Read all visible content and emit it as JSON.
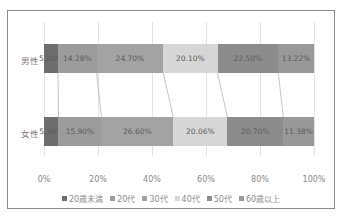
{
  "chart_data": {
    "type": "bar",
    "orientation": "horizontal",
    "stacked": "percent",
    "title": "",
    "xlabel": "",
    "ylabel": "",
    "xlim": [
      0,
      100
    ],
    "grid": true,
    "legend_position": "bottom",
    "categories": [
      "男性",
      "女性"
    ],
    "x_ticks": [
      "0%",
      "20%",
      "40%",
      "60%",
      "80%",
      "100%"
    ],
    "series": [
      {
        "name": "20歳未満",
        "color": "#6e6e6e",
        "values": [
          5.2,
          5.36
        ],
        "labels": [
          "5.20%",
          "5.36%"
        ]
      },
      {
        "name": "20代",
        "color": "#9c9c9c",
        "values": [
          14.28,
          15.9
        ],
        "labels": [
          "14.28%",
          "15.90%"
        ]
      },
      {
        "name": "30代",
        "color": "#a3a3a3",
        "values": [
          24.7,
          26.6
        ],
        "labels": [
          "24.70%",
          "26.60%"
        ]
      },
      {
        "name": "40代",
        "color": "#d6d6d6",
        "values": [
          20.1,
          20.06
        ],
        "labels": [
          "20.10%",
          "20.06%"
        ]
      },
      {
        "name": "50代",
        "color": "#8c8c8c",
        "values": [
          22.5,
          20.7
        ],
        "labels": [
          "22.50%",
          "20.70%"
        ]
      },
      {
        "name": "60歳以上",
        "color": "#999999",
        "values": [
          13.22,
          11.38
        ],
        "labels": [
          "13.22%",
          "11.38%"
        ]
      }
    ],
    "series_lines": true
  },
  "axis": {
    "ticks": [
      "0%",
      "20%",
      "40%",
      "60%",
      "80%",
      "100%"
    ]
  },
  "rows": [
    {
      "label": "男性"
    },
    {
      "label": "女性"
    }
  ],
  "legend": {
    "items": [
      "20歳未満",
      "20代",
      "30代",
      "40代",
      "50代",
      "60歳以上"
    ]
  }
}
